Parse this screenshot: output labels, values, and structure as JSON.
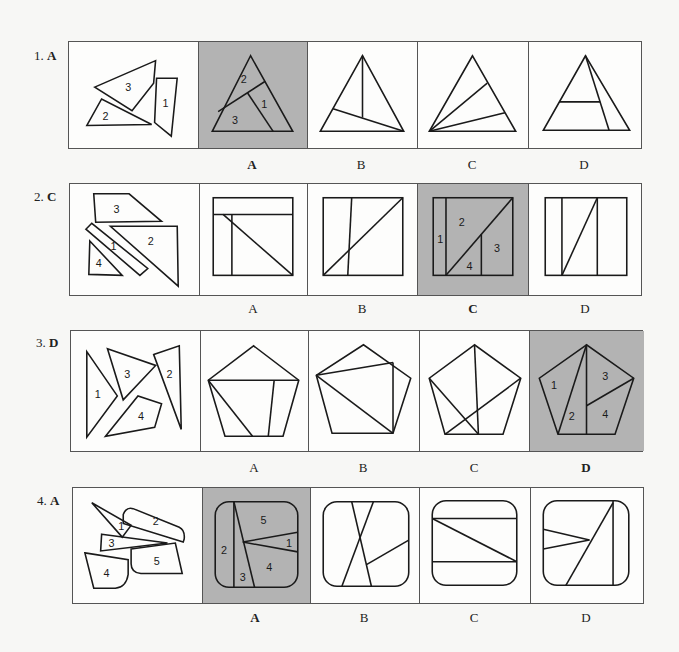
{
  "rows": [
    {
      "number": "1.",
      "answer": "A",
      "pieces_labels": [
        "1",
        "2",
        "3"
      ],
      "options": [
        {
          "letter": "A",
          "is_answer": true,
          "piece_labels": [
            "2",
            "1",
            "3"
          ]
        },
        {
          "letter": "B",
          "is_answer": false
        },
        {
          "letter": "C",
          "is_answer": false
        },
        {
          "letter": "D",
          "is_answer": false
        }
      ]
    },
    {
      "number": "2.",
      "answer": "C",
      "pieces_labels": [
        "3",
        "1",
        "2",
        "4"
      ],
      "options": [
        {
          "letter": "A",
          "is_answer": false
        },
        {
          "letter": "B",
          "is_answer": false
        },
        {
          "letter": "C",
          "is_answer": true,
          "piece_labels": [
            "1",
            "2",
            "3",
            "4"
          ]
        },
        {
          "letter": "D",
          "is_answer": false
        }
      ]
    },
    {
      "number": "3.",
      "answer": "D",
      "pieces_labels": [
        "1",
        "3",
        "2",
        "4"
      ],
      "options": [
        {
          "letter": "A",
          "is_answer": false
        },
        {
          "letter": "B",
          "is_answer": false
        },
        {
          "letter": "C",
          "is_answer": false
        },
        {
          "letter": "D",
          "is_answer": true,
          "piece_labels": [
            "1",
            "2",
            "3",
            "4"
          ]
        }
      ]
    },
    {
      "number": "4.",
      "answer": "A",
      "pieces_labels": [
        "1",
        "2",
        "3",
        "4",
        "5"
      ],
      "options": [
        {
          "letter": "A",
          "is_answer": true,
          "piece_labels": [
            "5",
            "2",
            "1",
            "3",
            "4"
          ]
        },
        {
          "letter": "B",
          "is_answer": false
        },
        {
          "letter": "C",
          "is_answer": false
        },
        {
          "letter": "D",
          "is_answer": false
        }
      ]
    }
  ],
  "colors": {
    "answer_highlight": "#b3b3b3",
    "line": "#1a1a1a",
    "frame": "#555555",
    "background": "#f7f7f5"
  }
}
